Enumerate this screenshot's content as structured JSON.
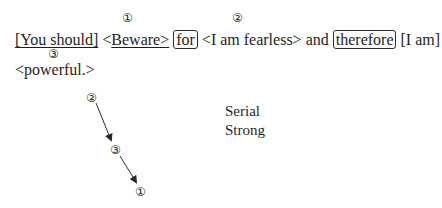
{
  "sentence": {
    "segments": [
      {
        "text": "[You should]",
        "style": "underline"
      },
      {
        "text": " <",
        "style": "plain"
      },
      {
        "text": "Beware>",
        "style": "underline"
      },
      {
        "text": " ",
        "style": "plain"
      },
      {
        "text": "for",
        "style": "boxed"
      },
      {
        "text": " <I am fearless> and ",
        "style": "plain"
      },
      {
        "text": "therefore",
        "style": "boxed"
      },
      {
        "text": " [I am]",
        "style": "plain"
      }
    ],
    "line2": "<powerful.>",
    "markers": {
      "beware": "①",
      "fearless": "②",
      "powerful": "③"
    }
  },
  "diagram": {
    "nodes": [
      {
        "id": "n2",
        "label": "②"
      },
      {
        "id": "n3",
        "label": "③"
      },
      {
        "id": "n1",
        "label": "①"
      }
    ],
    "edges": [
      {
        "from": "②",
        "to": "③"
      },
      {
        "from": "③",
        "to": "①"
      }
    ],
    "labels": {
      "line1": "Serial",
      "line2": "Strong"
    }
  }
}
